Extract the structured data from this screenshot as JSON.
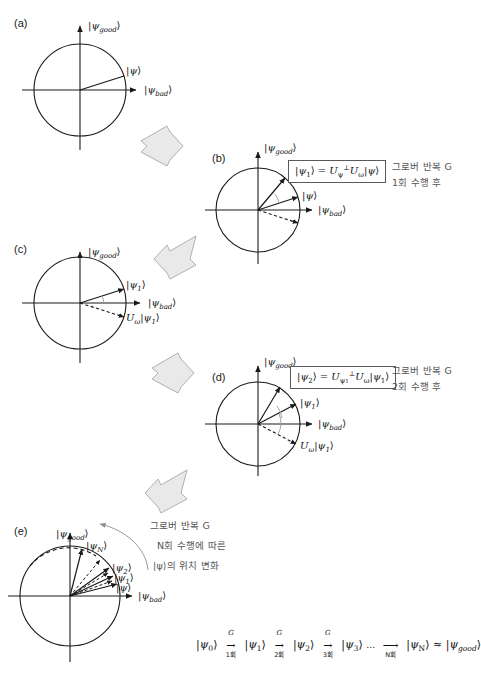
{
  "figure": {
    "background_color": "#ffffff",
    "stroke_color": "#1a1a1a",
    "block_arrow_fill": "#e8e8e8",
    "block_arrow_stroke": "#a8a8a8",
    "korean_text_color": "#555555"
  },
  "axis_labels": {
    "good": "|ψgood⟩",
    "good_base": "|ψ",
    "good_sub": "good",
    "good_close": "⟩",
    "bad_base": "|ψ",
    "bad_sub": "bad",
    "bad_close": "⟩"
  },
  "panels": [
    {
      "id": "a",
      "letter": "(a)",
      "vectors": [
        {
          "name": "psi",
          "label": "|ψ⟩",
          "style": "solid",
          "angle_deg": 17
        }
      ],
      "axis_good": "|ψgood⟩",
      "axis_bad": "|ψbad⟩"
    },
    {
      "id": "b",
      "letter": "(b)",
      "formula": "|ψ1⟩ = Uψ⊥ Uω |ψ⟩",
      "formula_parts": {
        "lhs": "|ψ",
        "lhs_sub": "1",
        "lhs_close": "⟩ = ",
        "op1": "U",
        "op1_sub": "ψ",
        "op1_sup": "⊥",
        "op2": "U",
        "op2_sub": "ω",
        "rhs": "|ψ⟩"
      },
      "caption_line1": "그로버 반복 G",
      "caption_line2": "1회 수행 후",
      "vectors": [
        {
          "name": "psi1",
          "label": "|ψ1⟩",
          "style": "solid",
          "angle_deg": 50
        },
        {
          "name": "psi",
          "label": "|ψ⟩",
          "style": "solid",
          "angle_deg": 17
        },
        {
          "name": "Uw_psi",
          "label": "",
          "style": "dashed",
          "angle_deg": -17
        }
      ]
    },
    {
      "id": "c",
      "letter": "(c)",
      "vectors": [
        {
          "name": "psi1",
          "label": "|ψ1⟩",
          "style": "solid",
          "angle_deg": 17
        },
        {
          "name": "Uw_psi1",
          "label": "Uω|ψ1⟩",
          "style": "dashed",
          "angle_deg": -17
        }
      ],
      "axis_good": "|ψgood⟩",
      "axis_bad": "|ψbad⟩"
    },
    {
      "id": "d",
      "letter": "(d)",
      "formula": "|ψ2⟩ = Uψ1⊥ Uω |ψ1⟩",
      "formula_parts": {
        "lhs": "|ψ",
        "lhs_sub": "2",
        "lhs_close": "⟩ = ",
        "op1": "U",
        "op1_sub": "ψ1",
        "op1_sup": "⊥",
        "op2": "U",
        "op2_sub": "ω",
        "rhs": "|ψ1⟩"
      },
      "caption_line1": "그로버 반복 G",
      "caption_line2": "2회 수행 후",
      "vectors": [
        {
          "name": "psi2",
          "label": "",
          "style": "solid",
          "angle_deg": 60
        },
        {
          "name": "psi1",
          "label": "|ψ1⟩",
          "style": "solid",
          "angle_deg": 28
        },
        {
          "name": "Uw_psi1",
          "label": "Uω|ψ1⟩",
          "style": "dashed",
          "angle_deg": -28
        }
      ]
    },
    {
      "id": "e",
      "letter": "(e)",
      "caption_line1": "그로버 반복 G",
      "caption_line2": "N회 수행에 따른",
      "caption_line3": "|ψ⟩의 위치 변화",
      "vectors": [
        {
          "name": "psiN",
          "label": "|ψN⟩",
          "style": "solid",
          "angle_deg": 76
        },
        {
          "name": "psi2",
          "label": "|ψ2⟩",
          "style": "solid",
          "angle_deg": 36
        },
        {
          "name": "psi1",
          "label": "|ψ1⟩",
          "style": "solid",
          "angle_deg": 25
        },
        {
          "name": "psi",
          "label": "|ψ⟩",
          "style": "solid",
          "angle_deg": 14
        },
        {
          "name": "dashed1",
          "label": "",
          "style": "dashed",
          "angle_deg": 45
        },
        {
          "name": "dashed2",
          "label": "",
          "style": "dashed",
          "angle_deg": 31
        },
        {
          "name": "dashed3",
          "label": "",
          "style": "dashed",
          "angle_deg": 20
        }
      ],
      "axis_good": "|ψgood⟩",
      "axis_bad": "|ψbad⟩"
    }
  ],
  "sequence": {
    "terms": [
      "|ψ0⟩",
      "|ψ1⟩",
      "|ψ2⟩",
      "|ψ3⟩",
      "|ψN⟩",
      "|ψgood⟩"
    ],
    "term_subs": [
      "0",
      "1",
      "2",
      "3",
      "N",
      "good"
    ],
    "operator": "G",
    "counts": [
      "1회",
      "2회",
      "3회",
      "N회"
    ],
    "ellipsis": "…",
    "approx": "≈"
  },
  "block_arrows": [
    {
      "name": "a-to-b",
      "direction": "down-right"
    },
    {
      "name": "b-to-c",
      "direction": "down-left"
    },
    {
      "name": "c-to-d",
      "direction": "down-right"
    },
    {
      "name": "d-to-e",
      "direction": "down-left"
    }
  ]
}
